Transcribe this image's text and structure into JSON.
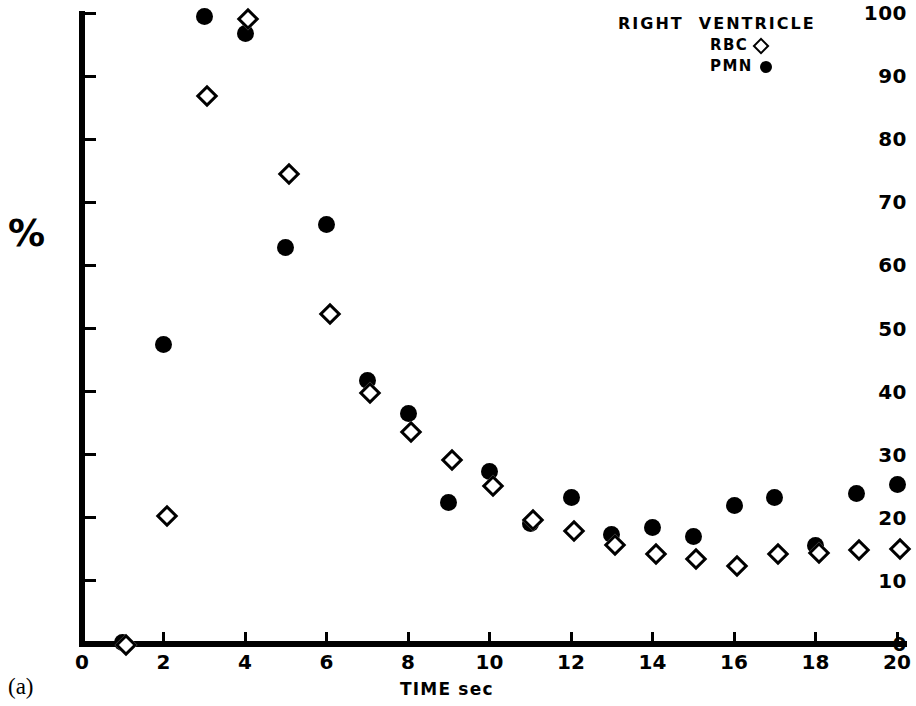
{
  "figure": {
    "panel_label": "(a)",
    "percent_label": "%",
    "x_axis_title": "TIME sec"
  },
  "legend": {
    "title": "RIGHT  VENTRICLE",
    "entries": [
      {
        "label": "RBC",
        "symbol": "open-diamond"
      },
      {
        "label": "PMN",
        "symbol": "filled-circle"
      }
    ]
  },
  "chart_data": {
    "type": "scatter",
    "title": "RIGHT VENTRICLE",
    "xlabel": "TIME sec",
    "ylabel": "%",
    "xlim": [
      0,
      20.4
    ],
    "ylim": [
      0,
      100
    ],
    "xticks": [
      0,
      2,
      4,
      6,
      8,
      10,
      12,
      14,
      16,
      18,
      20
    ],
    "yticks": [
      0,
      10,
      20,
      30,
      40,
      50,
      60,
      70,
      80,
      90,
      100
    ],
    "grid": false,
    "legend_position": "top-right",
    "x": [
      1,
      2,
      3,
      4,
      5,
      6,
      7,
      8,
      9,
      10,
      11,
      12,
      13,
      14,
      15,
      16,
      17,
      18,
      19,
      20
    ],
    "series": [
      {
        "name": "PMN",
        "symbol": "filled-circle",
        "color": "#000000",
        "values": [
          0.3,
          47.4,
          99.4,
          96.8,
          62.9,
          66.5,
          41.8,
          36.6,
          22.4,
          27.3,
          19.1,
          23.2,
          17.3,
          18.5,
          17.1,
          22.0,
          23.2,
          15.6,
          23.9,
          25.3
        ]
      },
      {
        "name": "RBC",
        "symbol": "open-diamond",
        "color": "#000000",
        "values": [
          0.3,
          20.8,
          87.4,
          99.5,
          74.9,
          52.8,
          40.3,
          34.0,
          29.6,
          25.5,
          20.1,
          18.4,
          16.2,
          14.7,
          13.9,
          12.8,
          14.7,
          14.9,
          15.4,
          15.6
        ]
      }
    ]
  }
}
